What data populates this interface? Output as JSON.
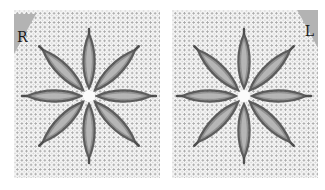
{
  "figure": {
    "panels": [
      {
        "id": "right-handed",
        "corner_label": "R",
        "corner_side": "top-left",
        "petals": 8
      },
      {
        "id": "left-handed",
        "corner_label": "L",
        "corner_side": "top-right",
        "petals": 8
      }
    ],
    "colors": {
      "fabric": "#f6f6f6",
      "fabric_holes": "#a9a9a9",
      "thread": "#5e5e5e",
      "thread_highlight": "#9a9a9a",
      "corner_tab": "#b3b3b3",
      "label_text": "#1a1a1a"
    }
  }
}
